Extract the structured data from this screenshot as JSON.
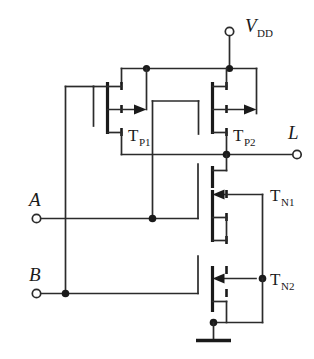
{
  "diagram": {
    "type": "circuit-schematic",
    "terminals": [
      {
        "id": "vdd",
        "label": "V",
        "sublabel": "DD",
        "kind": "supply-terminal",
        "x": 229,
        "y": 30
      },
      {
        "id": "out",
        "label": "L",
        "sublabel": "",
        "kind": "output-terminal",
        "x": 297,
        "y": 154
      },
      {
        "id": "in_a",
        "label": "A",
        "sublabel": "",
        "kind": "input-terminal",
        "x": 36,
        "y": 218
      },
      {
        "id": "in_b",
        "label": "B",
        "sublabel": "",
        "kind": "input-terminal",
        "x": 36,
        "y": 293
      }
    ],
    "transistors": [
      {
        "id": "tp1",
        "label": "T",
        "sublabel": "P1",
        "type": "pmos",
        "gate_input": "B",
        "x": 108,
        "y": 113
      },
      {
        "id": "tp2",
        "label": "T",
        "sublabel": "P2",
        "type": "pmos",
        "gate_input": "A",
        "x": 213,
        "y": 113
      },
      {
        "id": "tn1",
        "label": "T",
        "sublabel": "N1",
        "type": "nmos",
        "gate_input": "A",
        "x": 213,
        "y": 218
      },
      {
        "id": "tn2",
        "label": "T",
        "sublabel": "N2",
        "type": "nmos",
        "gate_input": "B",
        "x": 213,
        "y": 278
      }
    ],
    "ground": {
      "kind": "ground-symbol",
      "x": 213,
      "y": 340
    },
    "colors": {
      "wire": "#2b2b2b",
      "device": "#1a1a1a",
      "background": "#ffffff"
    }
  }
}
